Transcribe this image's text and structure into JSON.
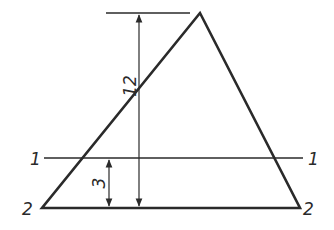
{
  "diagram": {
    "title": "",
    "stroke_color": "#2a2a2a",
    "background": "#ffffff",
    "triangle": {
      "apex": [
        200,
        13
      ],
      "base_left": [
        42,
        208
      ],
      "base_right": [
        300,
        208
      ]
    },
    "lines": {
      "line_1": {
        "y": 158,
        "x1": 44,
        "x2": 303,
        "label_left": "1",
        "label_right": "1"
      },
      "line_2": {
        "y": 208,
        "label_left": "2",
        "label_right": "2"
      },
      "top_extension": {
        "y": 13,
        "x1": 106,
        "x2": 190
      }
    },
    "dimensions": {
      "height_total": {
        "label": "12",
        "x": 139,
        "y1": 13,
        "y2": 208
      },
      "height_offset": {
        "label": "3",
        "x": 109,
        "y1": 158,
        "y2": 208
      }
    }
  }
}
